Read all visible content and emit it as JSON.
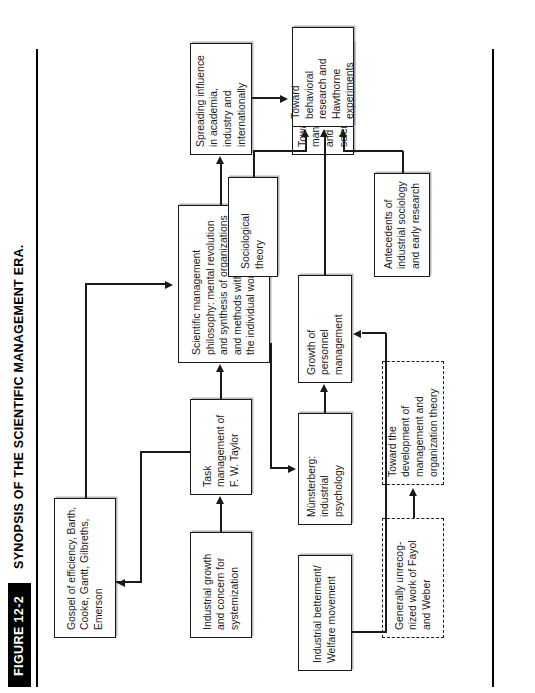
{
  "figure": {
    "number_label": "FIGURE 12-2",
    "caption": "SYNOPSIS OF THE SCIENTIFIC MANAGEMENT ERA."
  },
  "nodes": {
    "gospel_of_efficiency": "Gospel of efficiency, Barth, Cooke, Gantt, Gilbreths, Emerson",
    "industrial_growth": "Industrial growth and concern for systemization",
    "task_management": "Task management of F. W. Taylor",
    "scientific_management": "Scientific management philosophy: mental revolution and synthesis of organizations and methods with concern for the individual worker",
    "spreading_influence": "Spreading influence in academia, industry and internationally",
    "toward_general_management": "Toward general management view and management science",
    "generally_unrecognized": "Generally unrecog-nized work of Fayol and Weber",
    "toward_development": "Toward the development of management and organization theory",
    "industrial_betterment": "Industrial betterment/ Welfare movement",
    "munsterberg": "Münsterberg: industrial psychology",
    "growth_personnel": "Growth of personnel management",
    "sociological_theory": "Sociological theory",
    "antecedents_sociology": "Antecedents of industrial sociology and early research",
    "toward_behavioral": "Toward behavioral research and Hawthorne experiments"
  },
  "colors": {
    "ink": "#1a1a1a",
    "header_block": "#000000",
    "page": "#ffffff"
  }
}
